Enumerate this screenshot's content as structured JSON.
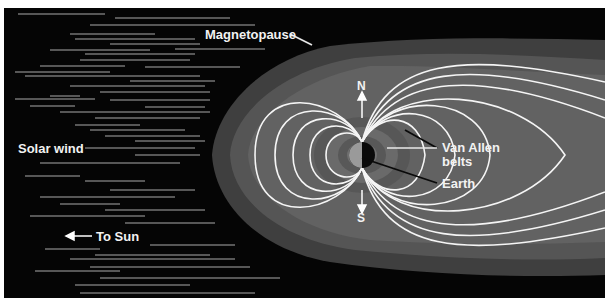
{
  "diagram": {
    "labels": {
      "magnetopause": "Magnetopause",
      "solar_wind": "Solar wind",
      "to_sun": "To Sun",
      "north": "N",
      "south": "S",
      "van_allen_line1": "Van Allen",
      "van_allen_line2": "belts",
      "earth": "Earth"
    },
    "colors": {
      "space": "#050505",
      "magnetopause_outer": "#3f3f3f",
      "magnetosphere_mid": "#5a5a5a",
      "magnetosphere_inner": "#6a6a6a",
      "field_lines": "#f5f5f5",
      "solar_wind_streaks": "#bdbdbd",
      "van_allen_belts": "#555555",
      "earth_day": "#9a9a9a",
      "earth_night": "#0a0a0a"
    }
  }
}
